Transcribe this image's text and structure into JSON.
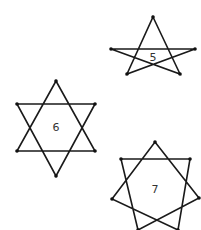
{
  "figure": {
    "stars": [
      {
        "label": "5",
        "type": "pentagram {5/2}",
        "vertices": [
          [
            153,
            17
          ],
          [
            195,
            49
          ],
          [
            180,
            74
          ],
          [
            127,
            74
          ],
          [
            111,
            49
          ]
        ],
        "path_order": [
          0,
          2,
          4,
          1,
          3
        ],
        "label_pos": [
          153,
          58
        ]
      },
      {
        "label": "6",
        "type": "hexagram {6/2}",
        "vertices": [
          [
            56,
            81
          ],
          [
            95,
            104
          ],
          [
            95,
            151
          ],
          [
            56,
            176
          ],
          [
            17,
            151
          ],
          [
            17,
            104
          ]
        ],
        "triangles": [
          [
            0,
            2,
            4
          ],
          [
            1,
            3,
            5
          ]
        ],
        "label_pos": [
          56,
          128
        ]
      },
      {
        "label": "7",
        "type": "heptagram {7/2}",
        "vertices": [
          [
            155,
            142
          ],
          [
            190,
            159
          ],
          [
            199,
            198
          ],
          [
            178,
            230
          ],
          [
            138,
            230
          ],
          [
            112,
            199
          ],
          [
            121,
            159
          ]
        ],
        "path_order": [
          0,
          2,
          4,
          6,
          1,
          3,
          5
        ],
        "label_pos": [
          155,
          190
        ]
      }
    ]
  }
}
